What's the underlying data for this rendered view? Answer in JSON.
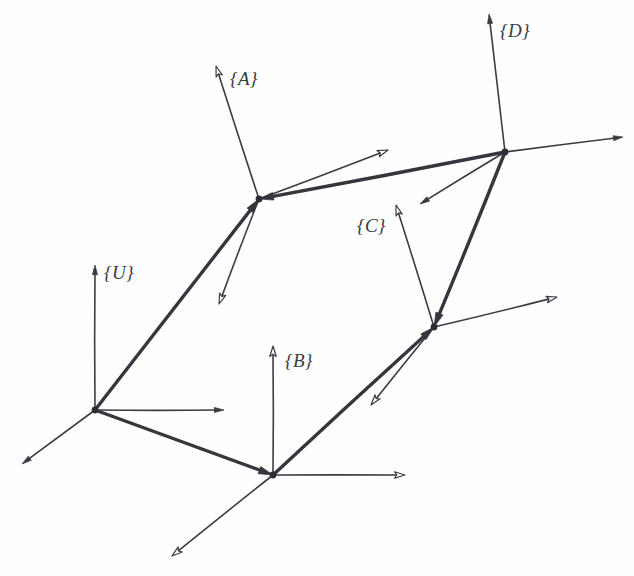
{
  "diagram": {
    "type": "frame-transform-diagram",
    "canvas": {
      "width": 634,
      "height": 576,
      "background": "#fefefe"
    },
    "style": {
      "axis_color": "#3b3b43",
      "axis_stroke_width": 1.6,
      "transform_color": "#36363e",
      "transform_stroke_width": 3.4,
      "origin_dot_color": "#2e2e36",
      "origin_dot_radius": 3.4,
      "label_color": "#3b3b43",
      "label_font_size": 19
    },
    "frames": [
      {
        "id": "U",
        "label": "{U}",
        "origin": {
          "x": 95,
          "y": 410
        },
        "label_pos": {
          "x": 104,
          "y": 262
        },
        "axes": [
          {
            "name": "y-axis",
            "tip": {
              "x": 95,
              "y": 265
            },
            "head": "solid"
          },
          {
            "name": "x-axis",
            "tip": {
              "x": 224,
              "y": 410
            },
            "head": "solid"
          },
          {
            "name": "z-axis",
            "tip": {
              "x": 22,
              "y": 464
            },
            "head": "solid"
          }
        ]
      },
      {
        "id": "A",
        "label": "{A}",
        "origin": {
          "x": 259,
          "y": 199
        },
        "label_pos": {
          "x": 230,
          "y": 68
        },
        "axes": [
          {
            "name": "y-axis",
            "tip": {
              "x": 216,
              "y": 66
            },
            "head": "open"
          },
          {
            "name": "x-axis",
            "tip": {
              "x": 388,
              "y": 150
            },
            "head": "open"
          },
          {
            "name": "z-axis",
            "tip": {
              "x": 219,
              "y": 304
            },
            "head": "open"
          }
        ]
      },
      {
        "id": "B",
        "label": "{B}",
        "origin": {
          "x": 273,
          "y": 475
        },
        "label_pos": {
          "x": 285,
          "y": 350
        },
        "axes": [
          {
            "name": "y-axis",
            "tip": {
              "x": 273,
              "y": 346
            },
            "head": "open"
          },
          {
            "name": "x-axis",
            "tip": {
              "x": 405,
              "y": 475
            },
            "head": "open"
          },
          {
            "name": "z-axis",
            "tip": {
              "x": 172,
              "y": 556
            },
            "head": "open"
          }
        ]
      },
      {
        "id": "C",
        "label": "{C}",
        "origin": {
          "x": 434,
          "y": 327
        },
        "label_pos": {
          "x": 357,
          "y": 215
        },
        "axes": [
          {
            "name": "y-axis",
            "tip": {
              "x": 396,
              "y": 205
            },
            "head": "open"
          },
          {
            "name": "x-axis",
            "tip": {
              "x": 557,
              "y": 297
            },
            "head": "open"
          },
          {
            "name": "z-axis",
            "tip": {
              "x": 371,
              "y": 405
            },
            "head": "open"
          }
        ]
      },
      {
        "id": "D",
        "label": "{D}",
        "origin": {
          "x": 505,
          "y": 152
        },
        "label_pos": {
          "x": 500,
          "y": 20
        },
        "axes": [
          {
            "name": "y-axis",
            "tip": {
              "x": 489,
              "y": 14
            },
            "head": "solid"
          },
          {
            "name": "x-axis",
            "tip": {
              "x": 623,
              "y": 137
            },
            "head": "solid"
          },
          {
            "name": "z-axis",
            "tip": {
              "x": 420,
              "y": 204
            },
            "head": "solid"
          }
        ]
      }
    ],
    "transforms": [
      {
        "name": "transform-u-to-a",
        "from": "U",
        "to": "A",
        "start": {
          "x": 95,
          "y": 410
        },
        "end": {
          "x": 259,
          "y": 199
        }
      },
      {
        "name": "transform-u-to-b",
        "from": "U",
        "to": "B",
        "start": {
          "x": 95,
          "y": 410
        },
        "end": {
          "x": 273,
          "y": 475
        }
      },
      {
        "name": "transform-b-to-c",
        "from": "B",
        "to": "C",
        "start": {
          "x": 273,
          "y": 475
        },
        "end": {
          "x": 434,
          "y": 327
        }
      },
      {
        "name": "transform-d-to-a",
        "from": "D",
        "to": "A",
        "start": {
          "x": 505,
          "y": 152
        },
        "end": {
          "x": 259,
          "y": 199
        }
      },
      {
        "name": "transform-d-to-c",
        "from": "D",
        "to": "C",
        "start": {
          "x": 505,
          "y": 152
        },
        "end": {
          "x": 434,
          "y": 327
        }
      }
    ]
  }
}
